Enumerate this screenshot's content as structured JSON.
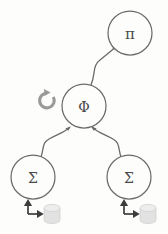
{
  "diagram": {
    "background_color": "#fdfdfc",
    "stroke_color": "#6b6b6b",
    "io_color": "#3d3d3d",
    "db_color": "#e2e2e2",
    "loop_color": "#9a9a9a",
    "nodes": [
      {
        "id": "pi",
        "label": "π",
        "cx": 130,
        "cy": 33,
        "r": 22,
        "font_size": 15
      },
      {
        "id": "phi",
        "label": "Φ",
        "cx": 84,
        "cy": 106,
        "r": 22,
        "font_size": 14
      },
      {
        "id": "sigma_l",
        "label": "Σ",
        "cx": 33,
        "cy": 177,
        "r": 22,
        "font_size": 14
      },
      {
        "id": "sigma_r",
        "label": "Σ",
        "cx": 129,
        "cy": 177,
        "r": 22,
        "font_size": 14
      }
    ],
    "edges": [
      {
        "id": "phi-to-pi",
        "from": "phi",
        "to": "pi",
        "style": "curved-arrow"
      },
      {
        "id": "sigma-l-to-phi",
        "from": "sigma_l",
        "to": "phi",
        "style": "curved-arrow"
      },
      {
        "id": "sigma-r-to-phi",
        "from": "sigma_r",
        "to": "phi",
        "style": "curved-arrow"
      }
    ],
    "storages": [
      {
        "id": "db_left",
        "for": "sigma_l",
        "cx": 52,
        "cy": 214
      },
      {
        "id": "db_right",
        "for": "sigma_r",
        "cx": 148,
        "cy": 214
      }
    ],
    "io_arrows": [
      {
        "id": "io_left",
        "for": "sigma_l",
        "description": "read-write between node and storage"
      },
      {
        "id": "io_right",
        "for": "sigma_r",
        "description": "read-write between node and storage"
      }
    ],
    "loop_icon": {
      "id": "phi_loop",
      "cx": 47,
      "cy": 100,
      "r": 7.5,
      "direction": "clockwise"
    }
  }
}
